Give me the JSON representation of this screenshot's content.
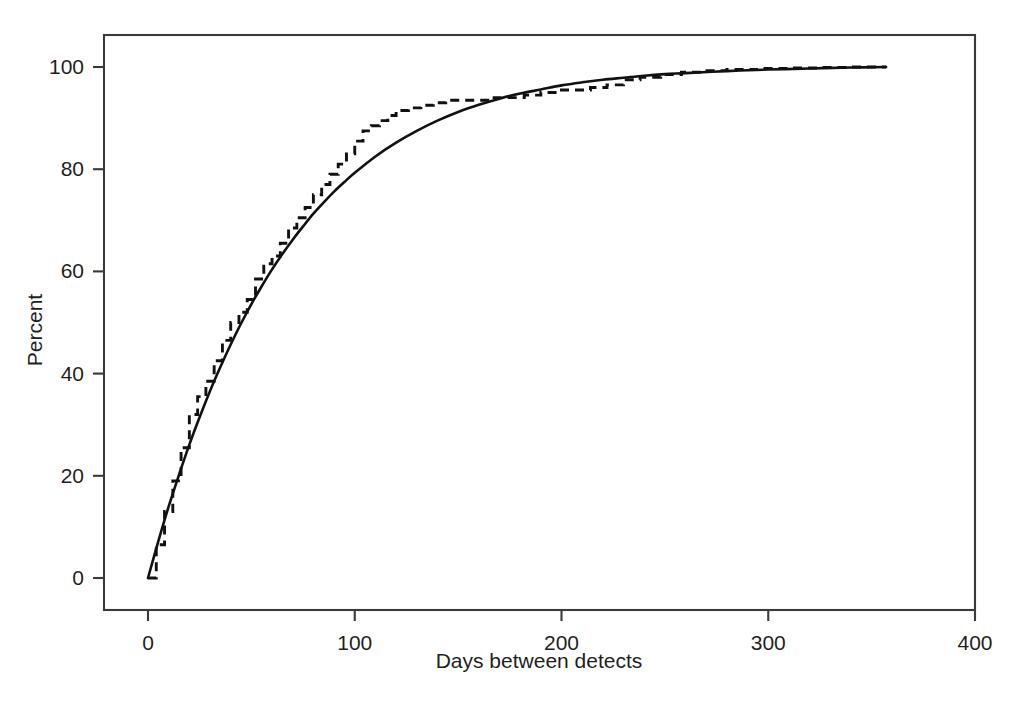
{
  "chart_data": {
    "type": "line",
    "title": "",
    "subtitle": "",
    "xlabel": "Days between detects",
    "ylabel": "Percent",
    "xlim": [
      0,
      400
    ],
    "ylim": [
      0,
      100
    ],
    "xticks": [
      0,
      100,
      200,
      300,
      400
    ],
    "yticks": [
      0,
      20,
      40,
      60,
      80,
      100
    ],
    "xtick_labels": [
      "0",
      "100",
      "200",
      "300",
      "400"
    ],
    "ytick_labels": [
      "0",
      "20",
      "40",
      "60",
      "80",
      "100"
    ],
    "grid": false,
    "legend": "none",
    "legend_position": "none",
    "frame": "box",
    "annotations": [],
    "series": [
      {
        "name": "Fitted cumulative distribution",
        "style": "solid",
        "color": "#111111",
        "x": [
          0,
          5,
          10,
          15,
          20,
          25,
          30,
          35,
          40,
          45,
          50,
          55,
          60,
          65,
          70,
          75,
          80,
          85,
          90,
          95,
          100,
          110,
          120,
          130,
          140,
          150,
          160,
          170,
          180,
          190,
          200,
          210,
          220,
          230,
          240,
          250,
          260,
          280,
          300,
          320,
          340,
          357
        ],
        "y": [
          0,
          7.2,
          14.0,
          20.2,
          26.1,
          31.5,
          36.6,
          41.3,
          45.7,
          49.8,
          53.6,
          57.1,
          60.4,
          63.4,
          66.2,
          68.8,
          71.3,
          73.5,
          75.6,
          77.5,
          79.3,
          82.5,
          85.2,
          87.5,
          89.5,
          91.2,
          92.6,
          93.8,
          94.8,
          95.6,
          96.4,
          97.0,
          97.5,
          97.9,
          98.3,
          98.6,
          98.8,
          99.2,
          99.5,
          99.7,
          99.9,
          100.0
        ]
      },
      {
        "name": "Empirical cumulative distribution",
        "style": "dashed",
        "color": "#111111",
        "x": [
          0,
          4,
          8,
          12,
          16,
          20,
          24,
          28,
          32,
          36,
          40,
          44,
          48,
          52,
          56,
          60,
          64,
          68,
          72,
          76,
          80,
          84,
          88,
          92,
          96,
          100,
          104,
          108,
          112,
          116,
          120,
          126,
          132,
          138,
          144,
          150,
          158,
          166,
          174,
          182,
          190,
          198,
          206,
          214,
          222,
          230,
          238,
          248,
          258,
          268,
          280,
          295,
          310,
          325,
          340,
          357
        ],
        "y": [
          0,
          6.5,
          13.0,
          19.0,
          25.5,
          32.0,
          35.5,
          38.5,
          42.5,
          46.5,
          50.0,
          52.0,
          54.5,
          58.5,
          61.5,
          63.0,
          65.5,
          68.5,
          70.5,
          72.5,
          75.0,
          77.0,
          79.0,
          81.0,
          83.0,
          85.5,
          87.5,
          88.5,
          89.5,
          90.5,
          91.5,
          92.0,
          92.5,
          93.0,
          93.5,
          93.5,
          93.5,
          94.0,
          94.0,
          94.5,
          95.0,
          95.5,
          95.5,
          96.0,
          96.5,
          97.5,
          98.0,
          98.5,
          99.0,
          99.3,
          99.5,
          99.7,
          99.8,
          99.9,
          100.0,
          100.0
        ]
      }
    ]
  },
  "axes": {
    "x_title": "Days between detects",
    "y_title": "Percent"
  }
}
